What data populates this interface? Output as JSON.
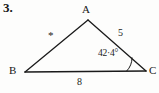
{
  "problem": {
    "number": "3."
  },
  "figure": {
    "type": "triangle-diagram",
    "vertices": [
      {
        "name": "A",
        "label": "A",
        "x": 88,
        "y": 20
      },
      {
        "name": "B",
        "label": "B",
        "x": 25,
        "y": 72
      },
      {
        "name": "C",
        "label": "C",
        "x": 146,
        "y": 71
      }
    ],
    "sides": [
      {
        "name": "AB",
        "label": "*",
        "known": false,
        "from": "A",
        "to": "B"
      },
      {
        "name": "AC",
        "label": "5",
        "known": true,
        "from": "A",
        "to": "C"
      },
      {
        "name": "BC",
        "label": "8",
        "known": true,
        "from": "B",
        "to": "C"
      }
    ],
    "angles": [
      {
        "name": "C",
        "label": "42·4°",
        "value": 42.4,
        "unit": "degrees",
        "at_vertex": "C"
      }
    ],
    "colors": {
      "stroke": "#1a1a1a",
      "background": "#fdfdfc",
      "text": "#161616"
    }
  }
}
